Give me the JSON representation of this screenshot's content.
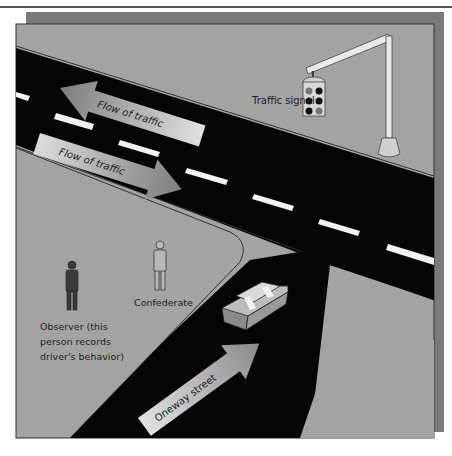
{
  "diagram": {
    "labels": {
      "traffic_signal": "Traffic signal",
      "flow_upper": "Flow of traffic",
      "flow_lower": "Flow of traffic",
      "confederate": "Confederate",
      "observer_line1": "Observer (this",
      "observer_line2": "person records",
      "observer_line3": "driver's behavior)",
      "oneway": "Oneway street"
    },
    "colors": {
      "ground": "#a3a3a3",
      "shadow": "#7a7a7a",
      "road": "#050505",
      "lane_marking": "#f2f2f2",
      "arrow_dark": "#8c8c8c",
      "arrow_light": "#d8d8d8",
      "frame_border": "#333333"
    },
    "elements": [
      "main-road",
      "side-street",
      "traffic-signal",
      "car",
      "observer-figure",
      "confederate-figure",
      "flow-arrow-left",
      "flow-arrow-right",
      "oneway-arrow"
    ]
  }
}
